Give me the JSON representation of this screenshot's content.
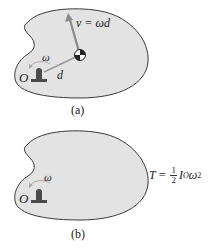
{
  "figure": {
    "panel_a": {
      "caption": "(a)",
      "velocity_label": "v = ωd",
      "velocity_var": "v",
      "velocity_expr": "= ωd",
      "distance_label": "d",
      "angular_velocity_label": "ω",
      "pivot_label": "O"
    },
    "panel_b": {
      "caption": "(b)",
      "angular_velocity_label": "ω",
      "pivot_label": "O",
      "equation": {
        "lhs": "T",
        "equals": "=",
        "frac_num": "1",
        "frac_den": "2",
        "inertia": "I",
        "inertia_sub": "O",
        "omega": "ω",
        "power": "2",
        "full_text": "T = ½ I_O ω²"
      }
    },
    "colors": {
      "body_fill": "#e3e3e3",
      "body_stroke": "#3a3a3a",
      "arrow": "#8a8a8a",
      "pedestal": "#4a4a4a",
      "distance_line": "#9a9a9a"
    }
  }
}
